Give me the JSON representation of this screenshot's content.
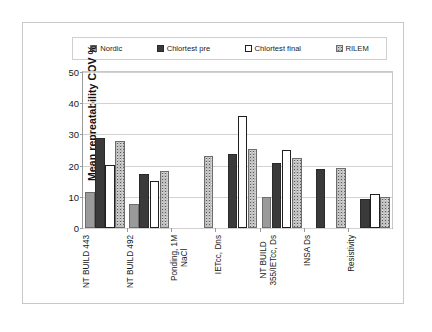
{
  "chart_data": {
    "type": "bar",
    "title": "",
    "xlabel": "",
    "ylabel": "Mean  repreatability COV %",
    "ylim": [
      0,
      50
    ],
    "yticks": [
      0,
      10,
      20,
      30,
      40,
      50
    ],
    "grid": true,
    "legend_position": "top",
    "categories": [
      "NT BUILD 443",
      "NT BUILD 492",
      "Ponding, 1M\nNaCl",
      "IETcc, Dns",
      "NT BUILD\n355/IETcc, Ds",
      "INSA Ds",
      "Resistivity"
    ],
    "series": [
      {
        "name": "Nordic",
        "color": "#9a9a9a",
        "pattern": "solid-gray",
        "values": [
          11.5,
          7.7,
          null,
          null,
          9.8,
          null,
          null
        ]
      },
      {
        "name": "Chlortest pre",
        "color": "#3a3a3a",
        "pattern": "solid-dark",
        "values": [
          29.0,
          17.2,
          null,
          23.7,
          20.7,
          19.0,
          9.4
        ]
      },
      {
        "name": "Chlortest final",
        "color": "#ffffff",
        "pattern": "outline-white",
        "values": [
          20.3,
          15.2,
          null,
          36.0,
          25.0,
          null,
          11.0
        ]
      },
      {
        "name": "RILEM",
        "color": "#bdbdbd",
        "pattern": "speckled",
        "values": [
          27.9,
          18.3,
          23.1,
          25.3,
          22.3,
          19.2,
          9.8
        ]
      }
    ]
  },
  "legend": {
    "items": [
      {
        "label": "Nordic"
      },
      {
        "label": "Chlortest pre"
      },
      {
        "label": "Chlortest final"
      },
      {
        "label": "RILEM"
      }
    ]
  }
}
